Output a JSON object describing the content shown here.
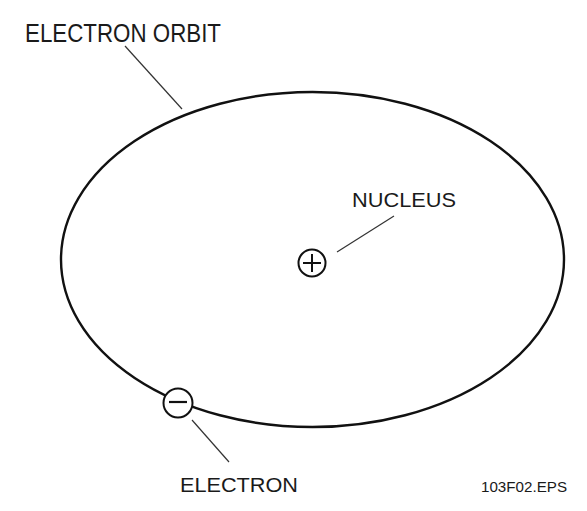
{
  "diagram": {
    "labels": {
      "orbit": "ELECTRON ORBIT",
      "nucleus": "NUCLEUS",
      "electron": "ELECTRON",
      "figure_id": "103F02.EPS"
    },
    "symbols": {
      "nucleus": "plus-in-circle",
      "electron": "minus-in-circle"
    },
    "colors": {
      "line": "#111111",
      "leader": "#333333",
      "background": "#ffffff"
    }
  }
}
